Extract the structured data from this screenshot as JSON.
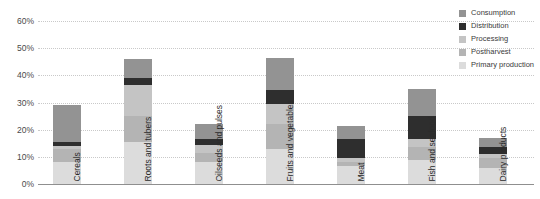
{
  "chart_data": {
    "type": "bar",
    "subtype": "stacked-bar",
    "title": "",
    "xlabel": "",
    "ylabel": "",
    "ylim": [
      0,
      60
    ],
    "ytick_labels": [
      "0%",
      "10%",
      "20%",
      "30%",
      "40%",
      "50%",
      "60%"
    ],
    "ytick_values": [
      0,
      10,
      20,
      30,
      40,
      50,
      60
    ],
    "grid": true,
    "legend_position": "top-right",
    "value_unit": "%",
    "categories": [
      "Cereals",
      "Roots and tubers",
      "Oilseeds and pulses",
      "Fruits and vegetables",
      "Meat",
      "Fish and seafood",
      "Dairy products"
    ],
    "series": [
      {
        "name": "Primary production",
        "color": "#dcdcdc",
        "values": [
          8.0,
          15.5,
          8.0,
          13.0,
          6.5,
          9.0,
          6.0
        ]
      },
      {
        "name": "Postharvest",
        "color": "#b4b4b4",
        "values": [
          5.0,
          9.5,
          3.5,
          9.0,
          1.5,
          4.5,
          3.5
        ]
      },
      {
        "name": "Processing",
        "color": "#c4c4c4",
        "values": [
          1.0,
          11.5,
          3.0,
          7.5,
          1.5,
          3.0,
          1.5
        ]
      },
      {
        "name": "Distribution",
        "color": "#2e2e2e",
        "values": [
          1.5,
          2.5,
          2.0,
          5.0,
          7.0,
          8.5,
          2.5
        ]
      },
      {
        "name": "Consumption",
        "color": "#939393",
        "values": [
          13.5,
          7.0,
          5.5,
          12.0,
          5.0,
          10.0,
          3.5
        ]
      }
    ],
    "totals": [
      29.0,
      46.0,
      22.0,
      46.5,
      21.5,
      35.0,
      17.0
    ]
  },
  "legend": {
    "items": [
      {
        "label": "Consumption",
        "color": "#939393"
      },
      {
        "label": "Distribution",
        "color": "#2e2e2e"
      },
      {
        "label": "Processing",
        "color": "#c4c4c4"
      },
      {
        "label": "Postharvest",
        "color": "#b4b4b4"
      },
      {
        "label": "Primary production",
        "color": "#dcdcdc"
      }
    ]
  },
  "axis": {
    "grid_color": "#c9c9c9",
    "baseline_color": "#8f8f8f",
    "tick_text_color": "#4a4a4a"
  }
}
